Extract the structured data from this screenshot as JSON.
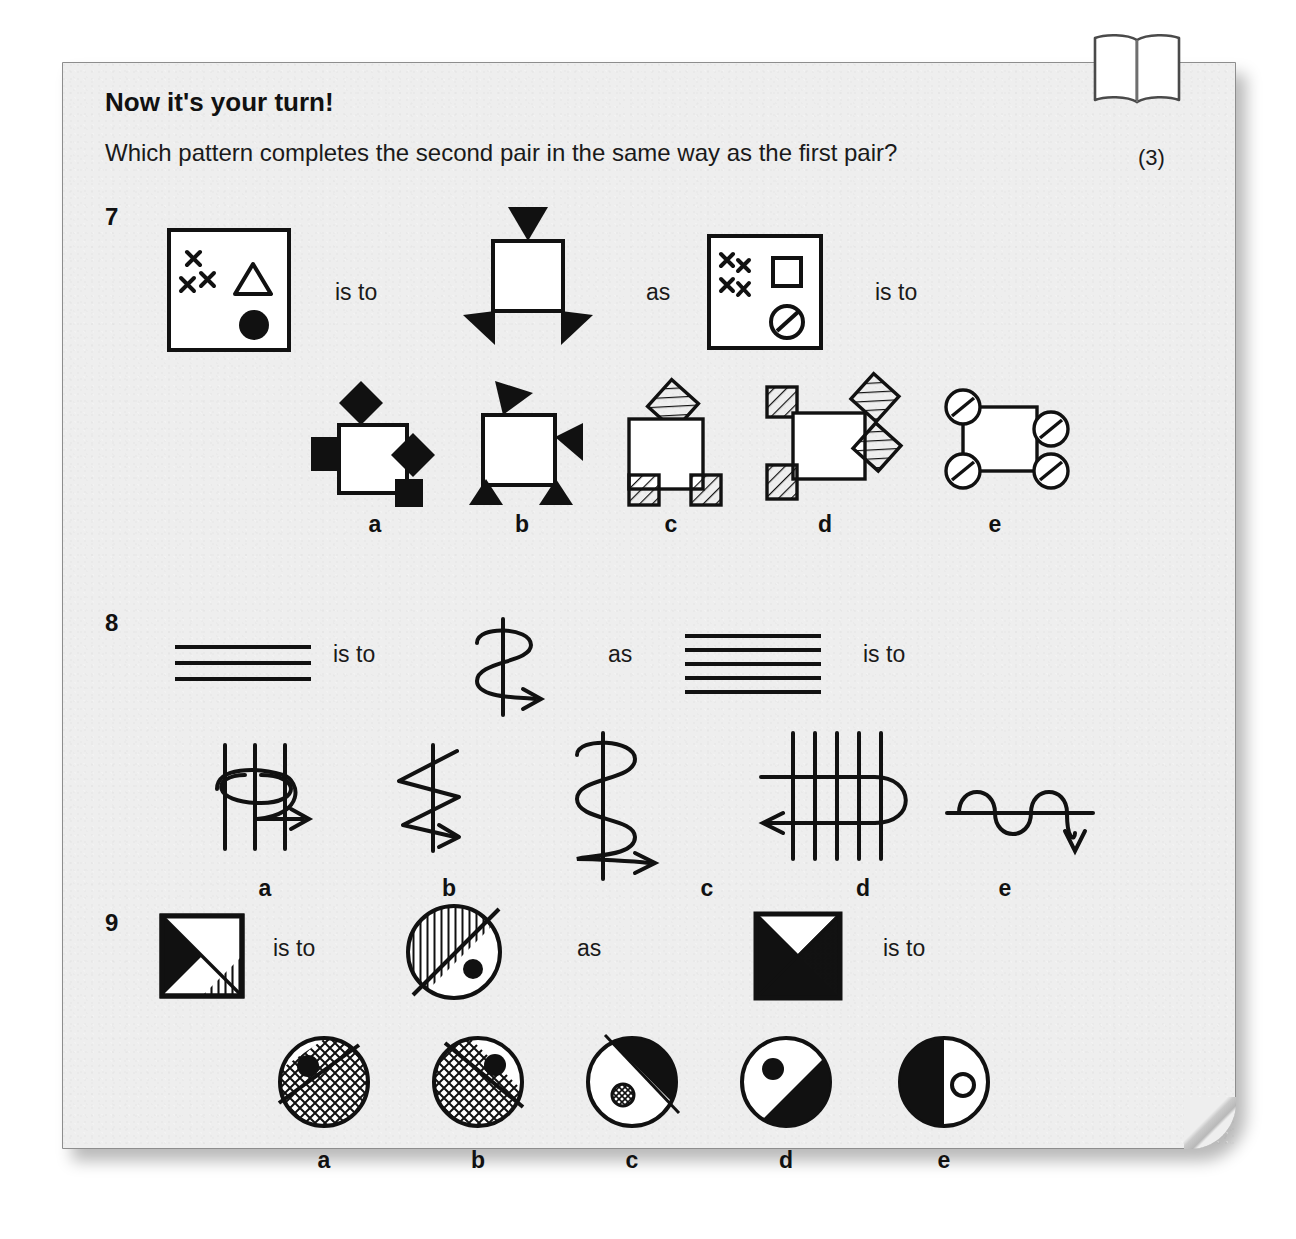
{
  "page": {
    "title": "Now it's your turn!",
    "prompt": "Which pattern completes the second pair in the same way as the first pair?",
    "marks": "(3)",
    "book_icon": "open-book-icon",
    "colors": {
      "card": "#eeeeee",
      "ink": "#111111",
      "border": "#8d8d8d"
    }
  },
  "connectors": {
    "is_to": "is to",
    "as": "as"
  },
  "option_labels": [
    "a",
    "b",
    "c",
    "d",
    "e"
  ],
  "questions": [
    {
      "number": "7",
      "stem": [
        {
          "role": "first-a",
          "icon": "box-with-three-crosses-triangle-filled-circle"
        },
        {
          "role": "connector",
          "icon": "is-to"
        },
        {
          "role": "first-b",
          "icon": "square-with-three-filled-triangles"
        },
        {
          "role": "connector",
          "icon": "as"
        },
        {
          "role": "second-a",
          "icon": "box-with-four-crosses-square-slashed-circle"
        },
        {
          "role": "connector",
          "icon": "is-to"
        }
      ],
      "options": [
        {
          "label": "a",
          "icon": "square-with-filled-diamonds-and-squares"
        },
        {
          "label": "b",
          "icon": "square-with-filled-triangles"
        },
        {
          "label": "c",
          "icon": "square-with-hatched-diamond-and-squares"
        },
        {
          "label": "d",
          "icon": "square-with-hatched-squares-and-diamonds"
        },
        {
          "label": "e",
          "icon": "square-with-slashed-circles"
        }
      ]
    },
    {
      "number": "8",
      "stem": [
        {
          "role": "first-a",
          "icon": "three-horizontal-lines"
        },
        {
          "role": "connector",
          "icon": "is-to"
        },
        {
          "role": "first-b",
          "icon": "vertical-line-with-two-loop-coil-right-arrow"
        },
        {
          "role": "connector",
          "icon": "as"
        },
        {
          "role": "second-a",
          "icon": "five-horizontal-lines"
        },
        {
          "role": "connector",
          "icon": "is-to"
        }
      ],
      "options": [
        {
          "label": "a",
          "icon": "three-vertical-lines-with-horizontal-coil-right-arrow"
        },
        {
          "label": "b",
          "icon": "vertical-line-with-zigzag-right-arrow"
        },
        {
          "label": "c",
          "icon": "vertical-line-with-three-loop-coil-right-arrow"
        },
        {
          "label": "d",
          "icon": "five-vertical-lines-with-horizontal-coil-left-arrow"
        },
        {
          "label": "e",
          "icon": "horizontal-sine-wave-down-arrow"
        }
      ]
    },
    {
      "number": "9",
      "stem": [
        {
          "role": "first-a",
          "icon": "square-black-triangle-and-vertical-striped-triangle"
        },
        {
          "role": "connector",
          "icon": "is-to"
        },
        {
          "role": "first-b",
          "icon": "circle-striped-half-with-filled-dot"
        },
        {
          "role": "connector",
          "icon": "as"
        },
        {
          "role": "second-a",
          "icon": "square-black-region-and-crosshatched-triangle"
        },
        {
          "role": "connector",
          "icon": "is-to"
        }
      ],
      "options": [
        {
          "label": "a",
          "icon": "circle-crosshatch-lower-half-dot-upper-left"
        },
        {
          "label": "b",
          "icon": "circle-crosshatch-lower-left-dot-upper-right"
        },
        {
          "label": "c",
          "icon": "circle-black-upper-right-small-hatched-circle"
        },
        {
          "label": "d",
          "icon": "circle-black-lower-right-filled-dot-upper-left"
        },
        {
          "label": "e",
          "icon": "circle-black-left-half-small-outline-circle"
        }
      ]
    }
  ]
}
